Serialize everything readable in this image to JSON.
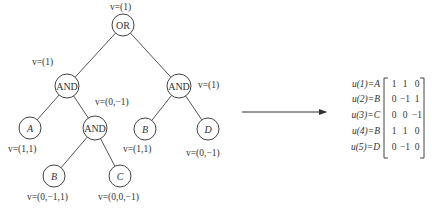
{
  "tree": {
    "nodes": [
      {
        "id": "or",
        "label": "OR",
        "type": "operator",
        "v": "v=(1)"
      },
      {
        "id": "and_left",
        "label": "AND",
        "type": "operator",
        "v": "v=(1)"
      },
      {
        "id": "and_right",
        "label": "AND",
        "type": "operator",
        "v": "v=(1)"
      },
      {
        "id": "leaf_a",
        "label": "A",
        "type": "leaf",
        "v": "v=(1,1)"
      },
      {
        "id": "and_mid",
        "label": "AND",
        "type": "operator",
        "v": "v=(0,−1)"
      },
      {
        "id": "leaf_b1",
        "label": "B",
        "type": "leaf",
        "v": "v=(0,−1,1)"
      },
      {
        "id": "leaf_c",
        "label": "C",
        "type": "leaf",
        "v": "v=(0,0,−1)"
      },
      {
        "id": "leaf_b2",
        "label": "B",
        "type": "leaf",
        "v": "v=(1,1)"
      },
      {
        "id": "leaf_d",
        "label": "D",
        "type": "leaf",
        "v": "v=(0,−1)"
      }
    ],
    "edges": [
      [
        "or",
        "and_left"
      ],
      [
        "or",
        "and_right"
      ],
      [
        "and_left",
        "leaf_a"
      ],
      [
        "and_left",
        "and_mid"
      ],
      [
        "and_mid",
        "leaf_b1"
      ],
      [
        "and_mid",
        "leaf_c"
      ],
      [
        "and_right",
        "leaf_b2"
      ],
      [
        "and_right",
        "leaf_d"
      ]
    ]
  },
  "matrix": {
    "rows": [
      {
        "label": "u(1)=A",
        "values": [
          "1",
          "1",
          "0"
        ]
      },
      {
        "label": "u(2)=B",
        "values": [
          "0",
          "−1",
          "1"
        ]
      },
      {
        "label": "u(3)=C",
        "values": [
          "0",
          "0",
          "−1"
        ]
      },
      {
        "label": "u(4)=B",
        "values": [
          "1",
          "1",
          "0"
        ]
      },
      {
        "label": "u(5)=D",
        "values": [
          "0",
          "−1",
          "0"
        ]
      }
    ]
  }
}
